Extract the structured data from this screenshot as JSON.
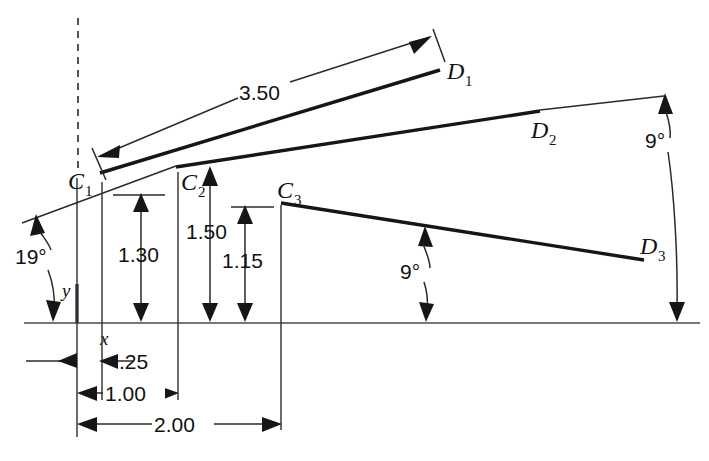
{
  "diagram": {
    "type": "engineering-dimension-diagram",
    "background_color": "#ffffff",
    "line_color": "#161616",
    "axes": {
      "x_label": "x",
      "y_label": "y",
      "origin_px": [
        77,
        323
      ]
    },
    "point_labels": {
      "c1": "C",
      "c1_sub": "1",
      "c2": "C",
      "c2_sub": "2",
      "c3": "C",
      "c3_sub": "3",
      "d1": "D",
      "d1_sub": "1",
      "d2": "D",
      "d2_sub": "2",
      "d3": "D",
      "d3_sub": "3"
    },
    "dimensions": [
      {
        "name": "length-c1-d1",
        "value": "3.50",
        "orientation": "oblique"
      },
      {
        "name": "height-c1",
        "value": "1.30",
        "orientation": "vertical"
      },
      {
        "name": "height-c2",
        "value": "1.50",
        "orientation": "vertical"
      },
      {
        "name": "height-c3",
        "value": "1.15",
        "orientation": "vertical"
      },
      {
        "name": "offset-x-small",
        "value": ".25",
        "orientation": "horizontal"
      },
      {
        "name": "span-origin-to-c2",
        "value": "1.00",
        "orientation": "horizontal"
      },
      {
        "name": "span-origin-to-c3",
        "value": "2.00",
        "orientation": "horizontal"
      }
    ],
    "angles": [
      {
        "name": "angle-c1-d1",
        "value": "19°"
      },
      {
        "name": "angle-c2-d2",
        "value": "9°"
      },
      {
        "name": "angle-c3-d3",
        "value": "9°"
      }
    ]
  }
}
